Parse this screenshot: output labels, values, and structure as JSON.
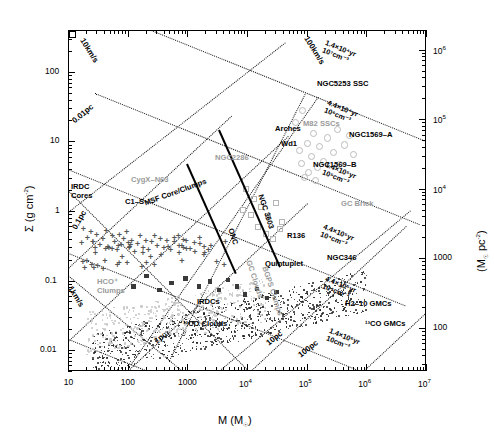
{
  "figure": {
    "domain": "scientific-scatter-plot",
    "background": "#ffffff"
  },
  "axes": {
    "x": {
      "label": "M (M☉)",
      "label_main": "M (M",
      "label_sub": "☉",
      "label_end": ")",
      "min": 10,
      "max": 10000000,
      "scale": "log",
      "ticks": [
        "10",
        "100",
        "1000",
        "10⁴",
        "10⁵",
        "10⁶",
        "10⁷"
      ],
      "tick_values": [
        10,
        100,
        1000,
        10000,
        100000,
        1000000,
        10000000
      ]
    },
    "y_left": {
      "label": "Σ (g cm⁻²)",
      "min": 0.005,
      "max": 400,
      "scale": "log",
      "ticks": [
        "100",
        "10",
        "1",
        "0.1",
        "0.01"
      ],
      "tick_values": [
        100,
        10,
        1,
        0.1,
        0.01
      ]
    },
    "y_right": {
      "label": "(M☉ pc⁻²)",
      "ticks": [
        "10⁶",
        "10⁵",
        "10⁴",
        "1000",
        "100"
      ],
      "tick_values": [
        1000000,
        100000,
        10000,
        1000,
        100
      ]
    }
  },
  "guide_lines": {
    "size_lines": [
      {
        "name": "radius-0.01pc",
        "label": "0.01pc"
      },
      {
        "name": "radius-0.1pc",
        "label": "0.1pc"
      },
      {
        "name": "radius-1pc",
        "label": "1pc"
      },
      {
        "name": "radius-10pc",
        "label": "10pc"
      },
      {
        "name": "radius-100pc",
        "label": "100pc"
      }
    ],
    "velocity_lines": [
      {
        "name": "escape-velocity-1kms",
        "label": "1km/s"
      },
      {
        "name": "escape-velocity-10kms",
        "label": "10km/s"
      },
      {
        "name": "escape-velocity-100kms",
        "label": "100km/s"
      }
    ],
    "timescale_lines": [
      {
        "name": "freefall-1",
        "line1": "1.4×10⁴yr",
        "line2": "10⁷cm⁻³"
      },
      {
        "name": "freefall-2",
        "line1": "4.4×10⁴yr",
        "line2": "10⁶cm⁻³"
      },
      {
        "name": "freefall-3",
        "line1": "1.4×10⁵yr",
        "line2": "10⁵cm⁻³"
      },
      {
        "name": "freefall-4",
        "line1": "4.4×10⁵yr",
        "line2": "10⁴cm⁻³"
      },
      {
        "name": "freefall-5",
        "line1": "1.4×10⁶yr",
        "line2": "10cm⁻³"
      }
    ]
  },
  "annotations": {
    "black": [
      {
        "name": "irdc-cores",
        "line1": "IRDC",
        "line2": "Cores"
      },
      {
        "name": "c1-s",
        "text": "C1–S"
      },
      {
        "name": "msf-core-clumps",
        "text": "MSF Core/Clumps"
      },
      {
        "name": "onc",
        "text": "ONC"
      },
      {
        "name": "ngc3603",
        "text": "NGC 3603"
      },
      {
        "name": "irdcs",
        "text": "IRDCs"
      },
      {
        "name": "13co-clouds",
        "text": "¹³CO Clouds"
      },
      {
        "name": "13co-gmcs",
        "text": "¹³CO GMCs"
      },
      {
        "name": "arches",
        "text": "Arches"
      },
      {
        "name": "wd1",
        "text": "Wd1"
      },
      {
        "name": "r136",
        "text": "R136"
      },
      {
        "name": "quintuplet",
        "text": "Quintuplet"
      },
      {
        "name": "ngc5253-ssc",
        "text": "NGC5253 SSC"
      },
      {
        "name": "ngc1569-a",
        "text": "NGC1569–A"
      },
      {
        "name": "ngc1569-b",
        "text": "NGC1569–B"
      },
      {
        "name": "ngc346",
        "text": "NGC346"
      },
      {
        "name": "h2-10-gmcs",
        "text": "H2–10 GMCs"
      }
    ],
    "gray": [
      {
        "name": "cygx-n63",
        "text": "CygX–N63"
      },
      {
        "name": "hco-clumps",
        "line1": "HCO⁺",
        "line2": "Clumps"
      },
      {
        "name": "gc-brick",
        "text": "GC Brick"
      },
      {
        "name": "m82-sscs",
        "text": "M82 SSCs"
      },
      {
        "name": "ngc2286",
        "text": "NGC2286"
      },
      {
        "name": "gc-clouds",
        "text": "GC Clouds"
      },
      {
        "name": "bgps-clumps",
        "text": "BGPS Clumps"
      }
    ]
  },
  "chart_data": {
    "type": "scatter",
    "title": "",
    "xlabel": "M (M☉)",
    "ylabel": "Σ (g cm⁻²)",
    "xscale": "log",
    "yscale": "log",
    "xlim": [
      10,
      10000000
    ],
    "ylim": [
      0.005,
      400
    ],
    "y2label": "(M☉ pc⁻²)",
    "y2lim": [
      25,
      2000000
    ],
    "grid": false,
    "legend": "none (in-plot text annotations)",
    "series": [
      {
        "name": "IRDC Cores",
        "marker": "cross",
        "color": "#555555",
        "points": [
          [
            18,
            0.55
          ],
          [
            21,
            0.42
          ],
          [
            24,
            0.5
          ],
          [
            26,
            0.36
          ],
          [
            30,
            0.46
          ],
          [
            34,
            0.33
          ],
          [
            38,
            0.4
          ],
          [
            43,
            0.52
          ],
          [
            48,
            0.3
          ],
          [
            55,
            0.44
          ],
          [
            60,
            0.36
          ],
          [
            66,
            0.28
          ],
          [
            72,
            0.46
          ],
          [
            78,
            0.33
          ],
          [
            85,
            0.4
          ],
          [
            95,
            0.5
          ],
          [
            105,
            0.3
          ],
          [
            115,
            0.38
          ],
          [
            130,
            0.26
          ],
          [
            145,
            0.34
          ],
          [
            160,
            0.44
          ],
          [
            180,
            0.3
          ],
          [
            200,
            0.38
          ],
          [
            220,
            0.28
          ],
          [
            250,
            0.36
          ],
          [
            280,
            0.44
          ],
          [
            310,
            0.32
          ],
          [
            350,
            0.4
          ],
          [
            400,
            0.3
          ],
          [
            450,
            0.38
          ],
          [
            520,
            0.28
          ],
          [
            600,
            0.36
          ],
          [
            700,
            0.44
          ],
          [
            800,
            0.32
          ],
          [
            950,
            0.38
          ],
          [
            1100,
            0.29
          ],
          [
            1300,
            0.35
          ],
          [
            1600,
            0.41
          ],
          [
            1900,
            0.31
          ]
        ]
      },
      {
        "name": "IRDCs",
        "marker": "filled-square",
        "color": "#3a3a3a",
        "points": [
          [
            120,
            0.085
          ],
          [
            200,
            0.12
          ],
          [
            330,
            0.075
          ],
          [
            520,
            0.095
          ],
          [
            900,
            0.11
          ],
          [
            1500,
            0.085
          ],
          [
            2300,
            0.1
          ],
          [
            3300,
            0.075
          ],
          [
            4600,
            0.105
          ],
          [
            6500,
            0.085
          ],
          [
            9000,
            0.065
          ],
          [
            14000,
            0.078
          ],
          [
            21000,
            0.058
          ],
          [
            30000,
            0.07
          ]
        ]
      },
      {
        "name": "13CO Clouds",
        "marker": "small-dot",
        "color": "#222222",
        "note": "dense scatter cloud, ~900 points, M 30–3×10⁵, Σ 0.006–0.08"
      },
      {
        "name": "BGPS / GC Clumps",
        "marker": "small-dot-gray",
        "color": "#c9c9c9",
        "note": "gray scatter cloud, M 20–2×10⁴, Σ 0.01–0.2"
      },
      {
        "name": "Young Massive Clusters",
        "marker": "open-square-errorbar",
        "color": "#000000",
        "points": [
          {
            "label": "Arches",
            "M": 20000,
            "S": 13.0
          },
          {
            "label": "Wd1",
            "M": 27000,
            "S": 8.5
          },
          {
            "label": "R136",
            "M": 30000,
            "S": 1.0
          },
          {
            "label": "Quintuplet",
            "M": 20000,
            "S": 0.45
          },
          {
            "label": "NGC 346",
            "M": 140000,
            "S": 0.2
          },
          {
            "label": "NGC5253 SSC",
            "M": 90000,
            "S": 55.0
          },
          {
            "label": "NGC1569-A",
            "M": 350000,
            "S": 11.0
          },
          {
            "label": "NGC1569-B",
            "M": 120000,
            "S": 4.0
          },
          {
            "label": "13CO GMCs",
            "M": 300000,
            "S": 0.037
          }
        ]
      },
      {
        "name": "M82 SSCs",
        "marker": "open-square-small",
        "color": "#555555",
        "points": [
          [
            80000,
            30.0
          ],
          [
            60000,
            20.0
          ],
          [
            120000,
            14.0
          ],
          [
            95000,
            10.0
          ],
          [
            70000,
            8.0
          ],
          [
            110000,
            6.5
          ],
          [
            150000,
            9.0
          ],
          [
            210000,
            12.0
          ],
          [
            300000,
            16.0
          ],
          [
            260000,
            7.5
          ],
          [
            180000,
            5.5
          ],
          [
            140000,
            4.5
          ],
          [
            100000,
            3.8
          ],
          [
            85000,
            3.2
          ],
          [
            130000,
            2.9
          ],
          [
            400000,
            9.5
          ],
          [
            480000,
            13.0
          ],
          [
            560000,
            7.0
          ],
          [
            330000,
            5.0
          ],
          [
            75000,
            5.2
          ]
        ]
      },
      {
        "name": "GC Clouds",
        "marker": "open-circle-gray",
        "color": "#bbbbbb",
        "points": [
          [
            9000,
            2.2
          ],
          [
            12000,
            1.6
          ],
          [
            16000,
            1.2
          ],
          [
            21000,
            0.9
          ],
          [
            28000,
            1.4
          ],
          [
            36000,
            0.75
          ],
          [
            14000,
            0.62
          ],
          [
            19000,
            0.5
          ],
          [
            25000,
            0.42
          ],
          [
            11000,
            0.95
          ],
          [
            8000,
            1.1
          ],
          [
            33000,
            0.58
          ]
        ]
      },
      {
        "name": "H2-10 GMCs",
        "marker": "open-square-gray",
        "color": "#8a8a8a",
        "points": [
          [
            900000,
            0.34
          ],
          [
            1200000,
            0.26
          ],
          [
            1500000,
            0.3
          ],
          [
            1000000,
            0.21
          ],
          [
            1300000,
            0.17
          ],
          [
            1700000,
            0.23
          ],
          [
            1100000,
            0.14
          ],
          [
            1450000,
            0.195
          ]
        ]
      }
    ],
    "tracks": [
      {
        "name": "ONC evolutionary track",
        "from": [
          700,
          1.55
        ],
        "to": [
          3200,
          0.085
        ]
      },
      {
        "name": "NGC 3603 evolutionary track",
        "from": [
          1100,
          4.3
        ],
        "to": [
          5200,
          0.1
        ]
      }
    ]
  }
}
